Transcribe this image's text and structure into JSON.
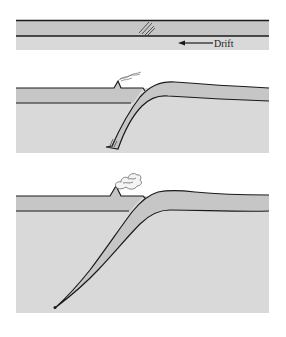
{
  "diagram": {
    "colors": {
      "background": "#ffffff",
      "plate": "#c6c6c6",
      "mantle": "#d9d9d9",
      "outline": "#1a1a1a"
    },
    "panels": [
      {
        "id": "stage-1",
        "description": "Flat lithosphere with incipient fracture",
        "labels": [
          {
            "text": "Drift",
            "arrow": "left-arrow"
          }
        ],
        "features": [
          "fracture-hatching"
        ]
      },
      {
        "id": "stage-2",
        "description": "Slab begins descending; small volcano with smoke",
        "labels": [],
        "features": [
          "volcano",
          "smoke-plume",
          "subducting-slab"
        ]
      },
      {
        "id": "stage-3",
        "description": "Slab descends deep into mantle; larger volcano erupting",
        "labels": [],
        "features": [
          "volcano",
          "eruption-cloud",
          "subducting-slab"
        ]
      }
    ]
  }
}
